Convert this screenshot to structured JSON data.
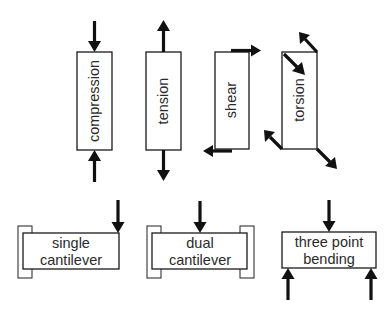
{
  "figure": {
    "top_row": [
      {
        "id": "compression",
        "label": "compression"
      },
      {
        "id": "tension",
        "label": "tension"
      },
      {
        "id": "shear",
        "label": "shear"
      },
      {
        "id": "torsion",
        "label": "torsion"
      }
    ],
    "bottom_row": [
      {
        "id": "single-cantilever",
        "line1": "single",
        "line2": "cantilever"
      },
      {
        "id": "dual-cantilever",
        "line1": "dual",
        "line2": "cantilever"
      },
      {
        "id": "three-point-bending",
        "line1": "three point",
        "line2": "bending"
      }
    ],
    "colors": {
      "stroke": "#1a1a1a",
      "arrow": "#111111",
      "text": "#2a2a2a",
      "background": "#ffffff"
    }
  }
}
